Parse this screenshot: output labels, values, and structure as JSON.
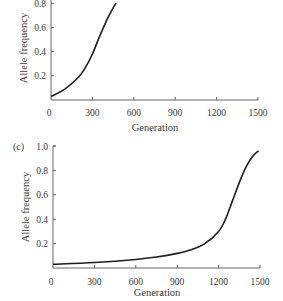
{
  "chart_data": [
    {
      "panel": "(b)",
      "type": "line",
      "title": "",
      "xlabel": "Generation",
      "ylabel": "Allele frequency",
      "xlim": [
        0,
        1500
      ],
      "ylim": [
        0,
        1.0
      ],
      "x_ticks": [
        "0",
        "300",
        "600",
        "900",
        "1200",
        "1500"
      ],
      "y_ticks": [
        "0.2",
        "0.4",
        "0.6",
        "0.8"
      ],
      "grid": false,
      "series": [
        {
          "name": "allele frequency",
          "x": [
            0,
            100,
            200,
            250,
            300,
            350,
            400,
            450,
            470
          ],
          "y": [
            0.03,
            0.09,
            0.19,
            0.27,
            0.38,
            0.52,
            0.65,
            0.76,
            0.8
          ]
        }
      ]
    },
    {
      "panel": "(c)",
      "type": "line",
      "title": "",
      "xlabel": "Generation",
      "ylabel": "Allele frequency",
      "xlim": [
        0,
        1500
      ],
      "ylim": [
        0,
        1.0
      ],
      "x_ticks": [
        "0",
        "300",
        "600",
        "900",
        "1200",
        "1500"
      ],
      "y_ticks": [
        "0.2",
        "0.4",
        "0.6",
        "0.8",
        "1.0"
      ],
      "grid": false,
      "series": [
        {
          "name": "allele frequency",
          "x": [
            0,
            300,
            600,
            750,
            900,
            1000,
            1100,
            1200,
            1250,
            1300,
            1350,
            1400,
            1450,
            1490
          ],
          "y": [
            0.03,
            0.045,
            0.07,
            0.09,
            0.12,
            0.15,
            0.2,
            0.3,
            0.4,
            0.55,
            0.7,
            0.83,
            0.92,
            0.96
          ]
        }
      ]
    }
  ],
  "panels": [
    {
      "label": "",
      "xlabel": "Generation",
      "ylabel": "Allele frequency",
      "x_ticks": [
        "0",
        "300",
        "600",
        "900",
        "1200",
        "1500"
      ],
      "y_ticks": [
        "0.2",
        "0.4",
        "0.6",
        "0.8"
      ]
    },
    {
      "label": "(c)",
      "xlabel": "Generation",
      "ylabel": "Allele frequency",
      "x_ticks": [
        "0",
        "300",
        "600",
        "900",
        "1200",
        "1500"
      ],
      "y_ticks": [
        "0.2",
        "0.4",
        "0.6",
        "0.8",
        "1.0"
      ]
    }
  ]
}
